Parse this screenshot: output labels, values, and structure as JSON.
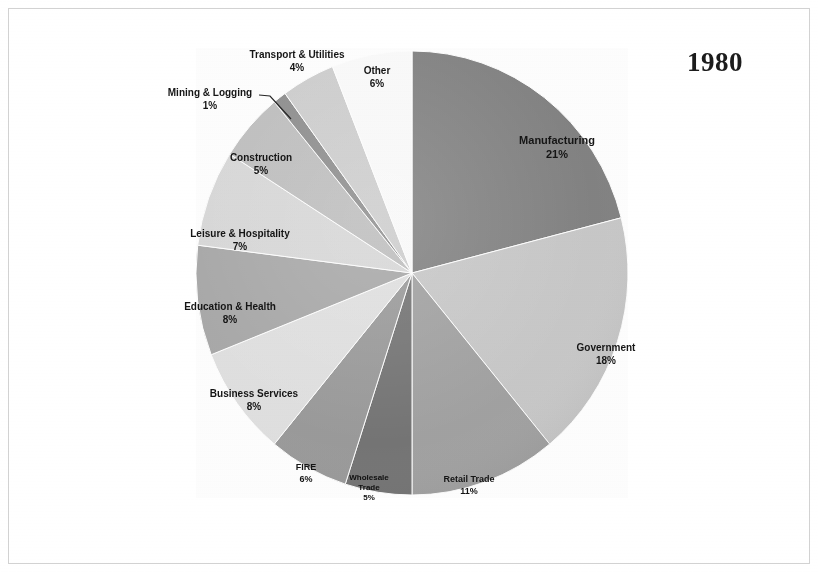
{
  "title": "1980",
  "chart_data": {
    "type": "pie",
    "title": "1980",
    "subtitle": "",
    "xlabel": "",
    "ylabel": "",
    "units": "percent",
    "start_angle_deg": 0,
    "direction": "clockwise",
    "legend": "none",
    "labels_position": "inside-and-outside-slices",
    "categories": [
      "Manufacturing",
      "Government",
      "Retail Trade",
      "Wholesale Trade",
      "FIRE",
      "Business Services",
      "Education & Health",
      "Leisure & Hospitality",
      "Construction",
      "Mining & Logging",
      "Transport & Utilities",
      "Other"
    ],
    "values": [
      21,
      18,
      11,
      5,
      6,
      8,
      8,
      7,
      5,
      1,
      4,
      6
    ],
    "value_labels": [
      "21%",
      "18%",
      "11%",
      "5%",
      "6%",
      "8%",
      "8%",
      "7%",
      "5%",
      "1%",
      "4%",
      "6%"
    ],
    "colors": [
      "#838383",
      "#c9c9c9",
      "#a2a2a2",
      "#757575",
      "#9b9b9b",
      "#e1e1e1",
      "#a9a9a9",
      "#d9d9d9",
      "#c0c0c0",
      "#8f8f8f",
      "#cfcfcf",
      "#fbfbfb"
    ],
    "slices": [
      {
        "name": "Manufacturing",
        "value": 21,
        "value_label": "21%",
        "color": "#838383"
      },
      {
        "name": "Government",
        "value": 18,
        "value_label": "18%",
        "color": "#c9c9c9"
      },
      {
        "name": "Retail Trade",
        "value": 11,
        "value_label": "11%",
        "color": "#a2a2a2"
      },
      {
        "name": "Wholesale Trade",
        "value": 5,
        "value_label": "5%",
        "color": "#757575"
      },
      {
        "name": "FIRE",
        "value": 6,
        "value_label": "6%",
        "color": "#9b9b9b"
      },
      {
        "name": "Business Services",
        "value": 8,
        "value_label": "8%",
        "color": "#e1e1e1"
      },
      {
        "name": "Education & Health",
        "value": 8,
        "value_label": "8%",
        "color": "#a9a9a9"
      },
      {
        "name": "Leisure & Hospitality",
        "value": 7,
        "value_label": "7%",
        "color": "#d9d9d9"
      },
      {
        "name": "Construction",
        "value": 5,
        "value_label": "5%",
        "color": "#c0c0c0"
      },
      {
        "name": "Mining & Logging",
        "value": 1,
        "value_label": "1%",
        "color": "#8f8f8f"
      },
      {
        "name": "Transport & Utilities",
        "value": 4,
        "value_label": "4%",
        "color": "#cfcfcf"
      },
      {
        "name": "Other",
        "value": 6,
        "value_label": "6%",
        "color": "#fbfbfb"
      }
    ]
  }
}
